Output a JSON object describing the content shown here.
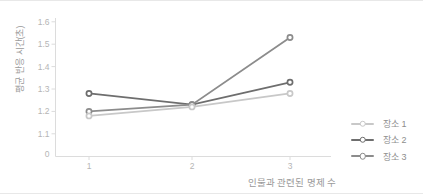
{
  "chart_data": {
    "type": "line",
    "title": "",
    "xlabel": "인물과 관련된 명제 수",
    "ylabel": "평균 반응 시간(초)",
    "categories": [
      "1",
      "2",
      "3"
    ],
    "series": [
      {
        "name": "장소 1",
        "color": "#c8c8c8",
        "values": [
          1.18,
          1.22,
          1.28
        ]
      },
      {
        "name": "장소 2",
        "color": "#6e6e6e",
        "values": [
          1.28,
          1.23,
          1.33
        ]
      },
      {
        "name": "장소 3",
        "color": "#8c8c8c",
        "values": [
          1.2,
          1.23,
          1.53
        ]
      }
    ],
    "y_ticks": [
      "0",
      "1.1",
      "1.2",
      "1.3",
      "1.4",
      "1.5",
      "1.6"
    ],
    "x_ticks": [
      "1",
      "2",
      "3"
    ],
    "ylim_display": [
      1.1,
      1.6
    ],
    "axis_break_zero": true,
    "grid": false,
    "legend_position": "right-bottom",
    "marker": "open-circle",
    "colors": {
      "axis_line": "#dcdcdc",
      "tick_label": "#b5b5b5",
      "axis_title": "#9a9a9a",
      "legend_label": "#8e8e8e",
      "marker_fill": "#ffffff"
    }
  }
}
